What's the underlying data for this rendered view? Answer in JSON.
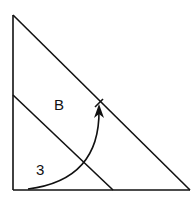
{
  "diagram": {
    "labels": {
      "region": "B",
      "distance": "3"
    },
    "colors": {
      "stroke": "#111111",
      "background": "#ffffff"
    },
    "elements": [
      "vertical-edge",
      "base-edge",
      "outer-hypotenuse",
      "inner-hypotenuse",
      "arc-arrow",
      "tick-mark"
    ]
  }
}
